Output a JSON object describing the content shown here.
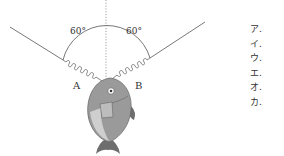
{
  "diagram": {
    "angle_left_label": "60°",
    "angle_right_label": "60°",
    "spring_a_label": "A",
    "spring_b_label": "B",
    "object": "fish-icon"
  },
  "options": [
    {
      "label": "ア."
    },
    {
      "label": "イ."
    },
    {
      "label": "ウ."
    },
    {
      "label": "エ."
    },
    {
      "label": "オ."
    },
    {
      "label": "カ."
    }
  ],
  "colors": {
    "line": "#555555",
    "fish_body": "#9a9a9a",
    "fish_belly": "#cfcfcf",
    "fish_fin": "#6e6e6e"
  }
}
